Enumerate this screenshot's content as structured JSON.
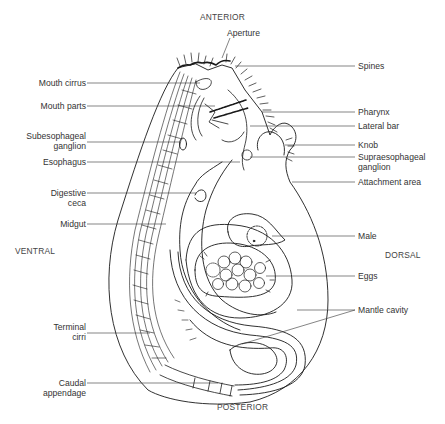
{
  "diagram": {
    "orientation": {
      "top": "ANTERIOR",
      "bottom": "POSTERIOR",
      "left": "VENTRAL",
      "right": "DORSAL"
    },
    "labels_left": [
      {
        "id": "mouth-cirrus",
        "text": "Mouth cirrus"
      },
      {
        "id": "mouth-parts",
        "text": "Mouth parts"
      },
      {
        "id": "subesophageal-ganglion",
        "line1": "Subesophageal",
        "line2": "ganglion"
      },
      {
        "id": "esophagus",
        "text": "Esophagus"
      },
      {
        "id": "digestive-ceca",
        "line1": "Digestive",
        "line2": "ceca"
      },
      {
        "id": "midgut",
        "text": "Midgut"
      },
      {
        "id": "terminal-cirri",
        "line1": "Terminal",
        "line2": "cirri"
      },
      {
        "id": "caudal-appendage",
        "line1": "Caudal",
        "line2": "appendage"
      }
    ],
    "labels_top": [
      {
        "id": "aperture",
        "text": "Aperture"
      }
    ],
    "labels_right": [
      {
        "id": "spines",
        "text": "Spines"
      },
      {
        "id": "pharynx",
        "text": "Pharynx"
      },
      {
        "id": "lateral-bar",
        "text": "Lateral bar"
      },
      {
        "id": "knob",
        "text": "Knob"
      },
      {
        "id": "supraesophageal-ganglion",
        "line1": "Supraesophageal",
        "line2": "ganglion"
      },
      {
        "id": "attachment-area",
        "text": "Attachment area"
      },
      {
        "id": "male",
        "text": "Male"
      },
      {
        "id": "eggs",
        "text": "Eggs"
      },
      {
        "id": "mantle-cavity",
        "text": "Mantle cavity"
      }
    ],
    "colors": {
      "line": "#1a1a1a",
      "text": "#333333",
      "background": "#ffffff"
    }
  }
}
